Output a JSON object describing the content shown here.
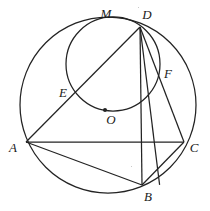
{
  "figure": {
    "stroke_color": "#232323",
    "background_color": "#ffffff",
    "label_color": "#1a1a1a"
  },
  "labels": {
    "M": "M",
    "D": "D",
    "F": "F",
    "E": "E",
    "O": "O",
    "A": "A",
    "C": "C",
    "B": "B"
  },
  "label_positions": {
    "M": {
      "x": 106,
      "y": 13
    },
    "D": {
      "x": 147,
      "y": 14
    },
    "F": {
      "x": 168,
      "y": 73
    },
    "E": {
      "x": 63,
      "y": 92
    },
    "O": {
      "x": 111,
      "y": 119
    },
    "A": {
      "x": 13,
      "y": 147
    },
    "C": {
      "x": 194,
      "y": 147
    },
    "B": {
      "x": 148,
      "y": 196
    }
  },
  "points": {
    "A": {
      "x": 26,
      "y": 142
    },
    "B": {
      "x": 142,
      "y": 185
    },
    "C": {
      "x": 184,
      "y": 142
    },
    "D": {
      "x": 140,
      "y": 27
    },
    "E": {
      "x": 72,
      "y": 97
    },
    "F": {
      "x": 160,
      "y": 80
    },
    "M": {
      "x": 110,
      "y": 19
    },
    "O": {
      "x": 105,
      "y": 110
    }
  },
  "circles": [
    {
      "name": "outer-circumcircle",
      "cx": 108,
      "cy": 105,
      "r": 88
    },
    {
      "name": "inner-circle",
      "cx": 113,
      "cy": 64,
      "r": 47
    }
  ],
  "segments": [
    {
      "name": "segment-A-C",
      "from": "A",
      "to": "C"
    },
    {
      "name": "segment-A-B",
      "from": "A",
      "to": "B"
    },
    {
      "name": "segment-A-D",
      "from": "A",
      "to": "D"
    },
    {
      "name": "segment-D-B",
      "from": "D",
      "to": "B"
    },
    {
      "name": "segment-D-C",
      "from": "D",
      "to": "C"
    },
    {
      "name": "segment-D-F-B",
      "from": "D",
      "to": "B"
    },
    {
      "name": "segment-B-C",
      "from": "B",
      "to": "C"
    }
  ],
  "center_dot": {
    "x": 105,
    "y": 110,
    "r": 2
  }
}
